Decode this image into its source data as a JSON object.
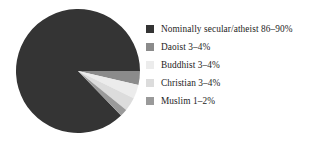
{
  "chart_data": {
    "type": "pie",
    "title": "",
    "subtitle": "",
    "xlabel": "",
    "ylabel": "",
    "grid": false,
    "legend_position": "right",
    "start_angle_deg": 0,
    "direction": "clockwise",
    "center": {
      "x": 78,
      "y": 71
    },
    "radius": 62,
    "categories": [
      "Nominally secular/atheist 86–90%",
      "Daoist 3–4%",
      "Buddhist 3–4%",
      "Christian 3–4%",
      "Muslim 1–2%"
    ],
    "values": [
      87.5,
      3.5,
      3.5,
      3.5,
      1.5
    ],
    "value_ranges": [
      {
        "label": "Nominally secular/atheist",
        "min": 86,
        "max": 90,
        "unit": "%"
      },
      {
        "label": "Daoist",
        "min": 3,
        "max": 4,
        "unit": "%"
      },
      {
        "label": "Buddhist",
        "min": 3,
        "max": 4,
        "unit": "%"
      },
      {
        "label": "Christian",
        "min": 3,
        "max": 4,
        "unit": "%"
      },
      {
        "label": "Muslim",
        "min": 1,
        "max": 2,
        "unit": "%"
      }
    ],
    "colors": [
      "#343434",
      "#8b8b8b",
      "#ececec",
      "#dcdcdc",
      "#9a9a9a"
    ],
    "slices": [
      {
        "label": "Nominally secular/atheist 86–90%",
        "value": 87.5,
        "color": "#343434",
        "start_deg": 46,
        "end_deg": 360
      },
      {
        "label": "Daoist 3–4%",
        "value": 3.5,
        "color": "#8b8b8b",
        "start_deg": 0,
        "end_deg": 13
      },
      {
        "label": "Buddhist 3–4%",
        "value": 3.5,
        "color": "#ececec",
        "start_deg": 13,
        "end_deg": 26
      },
      {
        "label": "Christian 3–4%",
        "value": 3.5,
        "color": "#dcdcdc",
        "start_deg": 26,
        "end_deg": 39
      },
      {
        "label": "Muslim 1–2%",
        "value": 1.5,
        "color": "#9a9a9a",
        "start_deg": 39,
        "end_deg": 46
      }
    ]
  },
  "legend": {
    "items": [
      {
        "label": "Nominally secular/atheist 86–90%",
        "color": "#343434",
        "swatch_icon": "legend-swatch-icon"
      },
      {
        "label": "Daoist 3–4%",
        "color": "#8b8b8b",
        "swatch_icon": "legend-swatch-icon"
      },
      {
        "label": "Buddhist 3–4%",
        "color": "#ececec",
        "swatch_icon": "legend-swatch-icon"
      },
      {
        "label": "Christian 3–4%",
        "color": "#dcdcdc",
        "swatch_icon": "legend-swatch-icon"
      },
      {
        "label": "Muslim 1–2%",
        "color": "#9a9a9a",
        "swatch_icon": "legend-swatch-icon"
      }
    ]
  },
  "palette": {
    "background": "#ffffff",
    "text": "#1d1d1d",
    "slice_dark": "#343434",
    "slice_medium": "#8b8b8b",
    "slice_light": "#ececec",
    "slice_light_alt": "#dcdcdc",
    "slice_medium_alt": "#9a9a9a"
  }
}
